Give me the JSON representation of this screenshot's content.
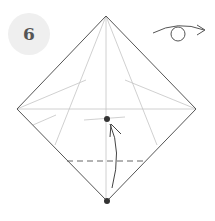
{
  "step": {
    "number": "6"
  },
  "diagram": {
    "colors": {
      "outline": "#555555",
      "crease": "#bbbbbb",
      "dot": "#333333",
      "badge_bg": "#efefef"
    },
    "symbols": [
      "turn-over-arrow",
      "fold-up-arrow",
      "valley-fold-dashed-line",
      "reference-dots"
    ]
  }
}
